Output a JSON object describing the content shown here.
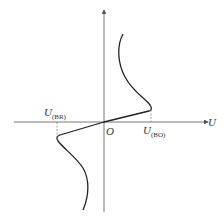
{
  "diagram": {
    "axis_x_label": "U",
    "origin_label": "O",
    "breakover_positive": {
      "label_main": "U",
      "label_sub": "(BO)"
    },
    "breakover_negative": {
      "label_main": "U",
      "label_sub": "(BR)"
    },
    "colors": {
      "axis": "#555555",
      "curve": "#222222",
      "dashed": "#777777",
      "text": "#333333"
    }
  }
}
